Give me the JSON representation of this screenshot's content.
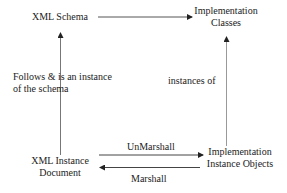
{
  "nodes": {
    "xml_schema": {
      "label": "XML Schema"
    },
    "impl_classes": {
      "line1": "Implementation",
      "line2": "Classes"
    },
    "xml_instance": {
      "line1": "XML Instance",
      "line2": "Document"
    },
    "impl_objects": {
      "line1": "Implementation",
      "line2": "Instance Objects"
    }
  },
  "edges": {
    "follows": {
      "line1": "Follows & is an instance",
      "line2": "of the schema"
    },
    "instances_of": {
      "label": "instances of"
    },
    "unmarshall": {
      "label": "UnMarshall"
    },
    "marshall": {
      "label": "Marshall"
    }
  },
  "colors": {
    "line": "#555555",
    "text": "#222222"
  }
}
